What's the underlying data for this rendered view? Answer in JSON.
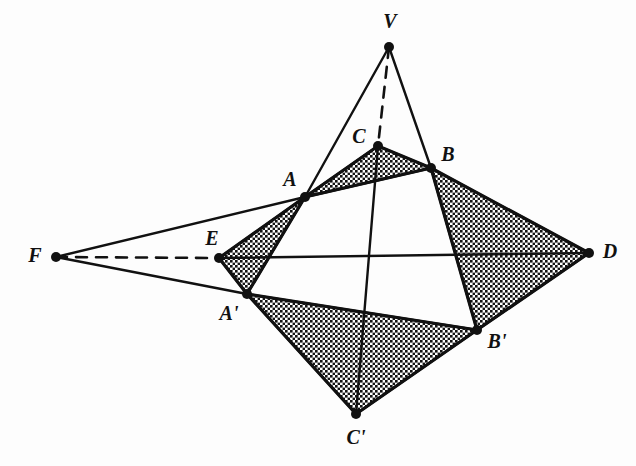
{
  "figure": {
    "kind": "geometry-diagram",
    "background_color": "#fdfdfd",
    "ink_color": "#111111",
    "hatch_color": "#1a1a1a",
    "canvas": {
      "width": 636,
      "height": 466
    }
  },
  "points": [
    {
      "id": "V",
      "label": "V",
      "x": 389,
      "y": 47,
      "label_x": 390,
      "label_y": 28,
      "dot": true
    },
    {
      "id": "C",
      "label": "C",
      "x": 378,
      "y": 146,
      "label_x": 359,
      "label_y": 143,
      "dot": true
    },
    {
      "id": "B",
      "label": "B",
      "x": 431,
      "y": 168,
      "label_x": 448,
      "label_y": 161,
      "dot": true
    },
    {
      "id": "A",
      "label": "A",
      "x": 305,
      "y": 197,
      "label_x": 290,
      "label_y": 186,
      "dot": true
    },
    {
      "id": "F",
      "label": "F",
      "x": 56,
      "y": 257,
      "label_x": 35,
      "label_y": 262,
      "dot": true
    },
    {
      "id": "E",
      "label": "E",
      "x": 219,
      "y": 258,
      "label_x": 212,
      "label_y": 245,
      "dot": true
    },
    {
      "id": "D",
      "label": "D",
      "x": 589,
      "y": 253,
      "label_x": 610,
      "label_y": 258,
      "dot": true
    },
    {
      "id": "Ap",
      "label": "A'",
      "x": 247,
      "y": 294,
      "label_x": 229,
      "label_y": 320,
      "dot": true
    },
    {
      "id": "Bp",
      "label": "B'",
      "x": 477,
      "y": 330,
      "label_x": 497,
      "label_y": 348,
      "dot": true
    },
    {
      "id": "Cp",
      "label": "C'",
      "x": 356,
      "y": 414,
      "label_x": 356,
      "label_y": 444,
      "dot": true
    }
  ],
  "shaded_faces": [
    {
      "id": "face-ACB",
      "vertices": [
        "A",
        "C",
        "B"
      ]
    },
    {
      "id": "face-AEAp",
      "vertices": [
        "A",
        "E",
        "Ap"
      ]
    },
    {
      "id": "face-BDBp",
      "vertices": [
        "B",
        "D",
        "Bp"
      ]
    },
    {
      "id": "face-ApBpCp",
      "vertices": [
        "Ap",
        "Bp",
        "Cp"
      ]
    }
  ],
  "solid_edges": [
    {
      "id": "edge-VA",
      "from": "V",
      "to": "A"
    },
    {
      "id": "edge-VB",
      "from": "V",
      "to": "B"
    },
    {
      "id": "edge-FA",
      "from": "F",
      "to": "A"
    },
    {
      "id": "edge-FAp",
      "from": "F",
      "to": "Ap"
    },
    {
      "id": "edge-AB",
      "from": "A",
      "to": "B"
    },
    {
      "id": "edge-AC",
      "from": "A",
      "to": "C"
    },
    {
      "id": "edge-CB",
      "from": "C",
      "to": "B"
    },
    {
      "id": "edge-AE",
      "from": "A",
      "to": "E"
    },
    {
      "id": "edge-EAp",
      "from": "E",
      "to": "Ap"
    },
    {
      "id": "edge-AAp",
      "from": "A",
      "to": "Ap"
    },
    {
      "id": "edge-BD",
      "from": "B",
      "to": "D"
    },
    {
      "id": "edge-DBp",
      "from": "D",
      "to": "Bp"
    },
    {
      "id": "edge-BBp",
      "from": "B",
      "to": "Bp"
    },
    {
      "id": "edge-ApBp",
      "from": "Ap",
      "to": "Bp"
    },
    {
      "id": "edge-BpCp",
      "from": "Bp",
      "to": "Cp"
    },
    {
      "id": "edge-ApCp",
      "from": "Ap",
      "to": "Cp"
    },
    {
      "id": "edge-ED",
      "from": "E",
      "to": "D"
    },
    {
      "id": "edge-CCp",
      "from": "C",
      "to": "Cp"
    }
  ],
  "dashed_edges": [
    {
      "id": "edge-VC",
      "from": "V",
      "to": "C"
    },
    {
      "id": "edge-FE",
      "from": "F",
      "to": "E"
    }
  ]
}
